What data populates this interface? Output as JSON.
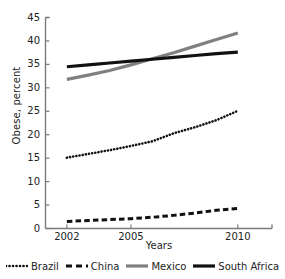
{
  "chart_data": {
    "type": "line",
    "title": "",
    "xlabel": "Years",
    "ylabel": "Obese, percent",
    "xlim": [
      2001,
      2011.6
    ],
    "ylim": [
      0,
      45
    ],
    "yticks": [
      0,
      5,
      10,
      15,
      20,
      25,
      30,
      35,
      40,
      45
    ],
    "xticks": [
      2002,
      2005,
      2010
    ],
    "xtick_labels": [
      "2002",
      "2005",
      "2010"
    ],
    "grid": false,
    "legend_position": "bottom",
    "x": [
      2002,
      2003,
      2004,
      2005,
      2006,
      2007,
      2008,
      2009,
      2010
    ],
    "series": [
      {
        "name": "Brazil",
        "style": "dotted",
        "color": "#111111",
        "values": [
          15.1,
          15.9,
          16.7,
          17.6,
          18.6,
          20.3,
          21.6,
          23.1,
          25.1
        ]
      },
      {
        "name": "China",
        "style": "dashed",
        "color": "#111111",
        "values": [
          1.5,
          1.7,
          1.9,
          2.1,
          2.4,
          2.8,
          3.3,
          3.9,
          4.3
        ]
      },
      {
        "name": "Mexico",
        "style": "solid",
        "color": "#808080",
        "values": [
          31.8,
          32.7,
          33.7,
          34.9,
          36.2,
          37.5,
          38.9,
          40.3,
          41.7
        ]
      },
      {
        "name": "South Africa",
        "style": "solid",
        "color": "#111111",
        "values": [
          34.5,
          34.9,
          35.3,
          35.7,
          36.1,
          36.5,
          36.9,
          37.3,
          37.6
        ]
      }
    ]
  },
  "axis": {
    "ylabel": "Obese, percent",
    "xlabel": "Years",
    "ytick_labels": [
      "0",
      "5",
      "10",
      "15",
      "20",
      "25",
      "30",
      "35",
      "40",
      "45"
    ],
    "xtick_labels": [
      "2002",
      "2005",
      "2010"
    ]
  },
  "legend": {
    "items": [
      {
        "label": "Brazil",
        "style": "dotted",
        "color": "#111111"
      },
      {
        "label": "China",
        "style": "dashed",
        "color": "#111111"
      },
      {
        "label": "Mexico",
        "style": "solid",
        "color": "#808080"
      },
      {
        "label": "South Africa",
        "style": "solid",
        "color": "#111111"
      }
    ]
  },
  "colors": {
    "axis": "#7a7a7a",
    "text": "#232323",
    "mexico": "#808080",
    "dark": "#111111",
    "background": "#ffffff"
  }
}
